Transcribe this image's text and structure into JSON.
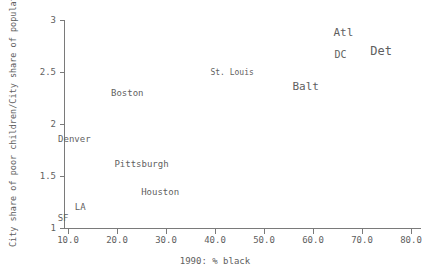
{
  "chart_data": {
    "type": "scatter",
    "title": "",
    "xlabel": "1990: % black",
    "ylabel": "City share of poor children/City share of population",
    "xlim": [
      6.0,
      78.5
    ],
    "ylim": [
      0.93,
      3.07
    ],
    "xticks": [
      "10.0",
      "20.0",
      "30.0",
      "40.0",
      "50.0",
      "60.0",
      "70.0",
      "80.0"
    ],
    "xtick_values": [
      10,
      20,
      30,
      40,
      50,
      60,
      70,
      80
    ],
    "yticks": [
      "1",
      "1.5",
      "2",
      "2.5",
      "3"
    ],
    "ytick_values": [
      1,
      1.5,
      2,
      2.5,
      3
    ],
    "grid": false,
    "legend": "none",
    "marker_style": "text-label",
    "points": [
      {
        "label": "SF",
        "x": 9.0,
        "y": 1.095,
        "size": 9
      },
      {
        "label": "LA",
        "x": 12.5,
        "y": 1.2,
        "size": 9
      },
      {
        "label": "Denver",
        "x": 11.3,
        "y": 1.855,
        "size": 9
      },
      {
        "label": "Boston",
        "x": 22.1,
        "y": 2.3,
        "size": 9
      },
      {
        "label": "Pittsburgh",
        "x": 25.0,
        "y": 1.62,
        "size": 9
      },
      {
        "label": "Houston",
        "x": 28.8,
        "y": 1.345,
        "size": 9
      },
      {
        "label": "St. Louis",
        "x": 43.5,
        "y": 2.49,
        "size": 8
      },
      {
        "label": "Balt",
        "x": 58.5,
        "y": 2.37,
        "size": 11
      },
      {
        "label": "Atl",
        "x": 66.2,
        "y": 2.88,
        "size": 11
      },
      {
        "label": "DC",
        "x": 65.6,
        "y": 2.665,
        "size": 10
      },
      {
        "label": "Det",
        "x": 73.9,
        "y": 2.7,
        "size": 12
      }
    ]
  },
  "colors": {
    "axis": "#7a7a7a",
    "text": "#5f5f5f",
    "background": "#ffffff"
  }
}
